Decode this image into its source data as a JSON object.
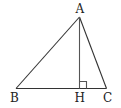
{
  "diagram": {
    "type": "geometry-triangle",
    "points": {
      "A": {
        "label": "A",
        "x": 79.5,
        "y": 17
      },
      "B": {
        "label": "B",
        "x": 16,
        "y": 88.5
      },
      "C": {
        "label": "C",
        "x": 106.5,
        "y": 88.5
      },
      "H": {
        "label": "H",
        "x": 79.5,
        "y": 88.5
      }
    },
    "segments": [
      "AB",
      "AC",
      "BC",
      "AH"
    ],
    "right_angle_at": "H",
    "colors": {
      "stroke": "#333333",
      "text": "#222222",
      "background": "#ffffff"
    }
  }
}
